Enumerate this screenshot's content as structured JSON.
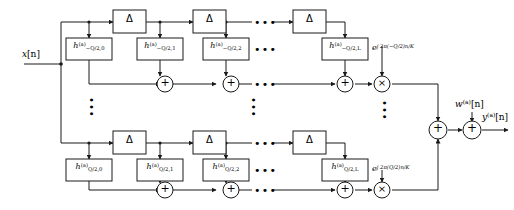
{
  "figure": {
    "type": "block-diagram",
    "domain": "signal-processing",
    "background": "#ffffff",
    "line_color": "#1a1a1a"
  },
  "signals": {
    "input": "x[n]",
    "noise": "w(a)[n]",
    "output": "y(a)[n]"
  },
  "input_label": {
    "base": "x",
    "arg": "[n]"
  },
  "noise_label": {
    "base": "w",
    "sup": "(a)",
    "arg": "[n]"
  },
  "output_label": {
    "base": "y",
    "sup": "(a)",
    "arg": "[n]"
  },
  "delay_symbol": "Δ",
  "adder_symbol": "+",
  "multiplier_symbol": "×",
  "ellipsis_h": "•••",
  "ellipsis_v": "•••",
  "branches": [
    {
      "id": "top",
      "q_label": "−Q/2",
      "filters": [
        {
          "base": "h",
          "sup": "(a)",
          "sub": "−Q/2,0"
        },
        {
          "base": "h",
          "sup": "(a)",
          "sub": "−Q/2,1"
        },
        {
          "base": "h",
          "sup": "(a)",
          "sub": "−Q/2,2"
        },
        {
          "base": "h",
          "sup": "(a)",
          "sub": "−Q/2,L"
        }
      ],
      "exponential": {
        "base": "e",
        "exponent": "j 2π(−Q/2)n/K"
      },
      "delays": [
        "Δ",
        "Δ",
        "Δ"
      ],
      "adders": 3,
      "multipliers": 1
    },
    {
      "id": "bottom",
      "q_label": "Q/2",
      "filters": [
        {
          "base": "h",
          "sup": "(a)",
          "sub": "Q/2,0"
        },
        {
          "base": "h",
          "sup": "(a)",
          "sub": "Q/2,1"
        },
        {
          "base": "h",
          "sup": "(a)",
          "sub": "Q/2,2"
        },
        {
          "base": "h",
          "sup": "(a)",
          "sub": "Q/2,L"
        }
      ],
      "exponential": {
        "base": "e",
        "exponent": "j 2π(Q/2)n/K"
      },
      "delays": [
        "Δ",
        "Δ",
        "Δ"
      ],
      "adders": 3,
      "multipliers": 1
    }
  ],
  "output_stage": {
    "combine_adder": "+",
    "noise_adder": "+"
  }
}
